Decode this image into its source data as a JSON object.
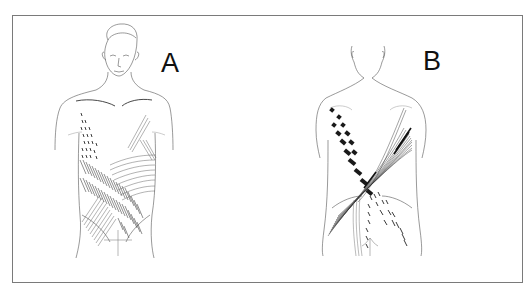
{
  "figure": {
    "frame_color": "#7a7a7a",
    "line_color": "#444444",
    "hatch_color": "#222222",
    "panels": [
      {
        "id": "A",
        "label": "A",
        "view": "anterior (front)",
        "region": "chest and abdomen"
      },
      {
        "id": "B",
        "label": "B",
        "view": "posterior (back)",
        "region": "back and lumbar"
      }
    ]
  }
}
